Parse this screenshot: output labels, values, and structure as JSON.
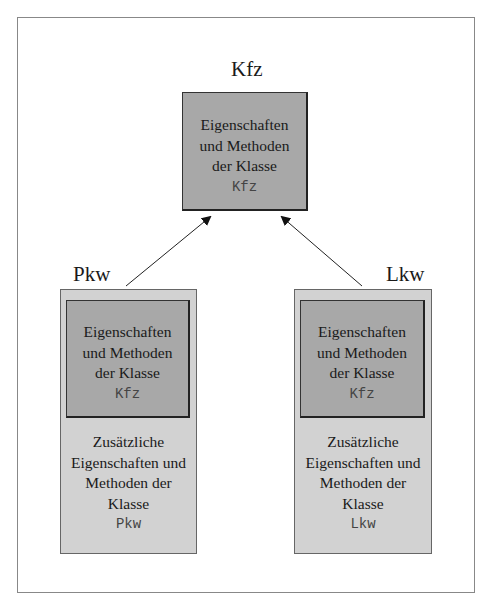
{
  "diagram": {
    "top_class": {
      "name": "Kfz",
      "lines": [
        "Eigenschaften",
        "und Methoden",
        "der Klasse"
      ],
      "class_ref": "Kfz"
    },
    "left_class": {
      "name": "Pkw",
      "inherited": {
        "lines": [
          "Eigenschaften",
          "und Methoden",
          "der Klasse"
        ],
        "class_ref": "Kfz"
      },
      "own": {
        "lines": [
          "Zusätzliche",
          "Eigenschaften und",
          "Methoden der",
          "Klasse"
        ],
        "class_ref": "Pkw"
      }
    },
    "right_class": {
      "name": "Lkw",
      "inherited": {
        "lines": [
          "Eigenschaften",
          "und Methoden",
          "der Klasse"
        ],
        "class_ref": "Kfz"
      },
      "own": {
        "lines": [
          "Zusätzliche",
          "Eigenschaften und",
          "Methoden der",
          "Klasse"
        ],
        "class_ref": "Lkw"
      }
    },
    "colors": {
      "inner_fill": "#a8a8a8",
      "outer_fill": "#d2d2d2",
      "frame": "#888888"
    }
  }
}
